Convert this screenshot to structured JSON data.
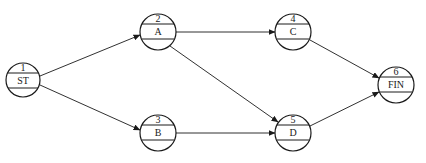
{
  "diagram": {
    "type": "activity-on-node network",
    "nodes": [
      {
        "id": "1",
        "number": "1",
        "label": "ST",
        "cx": 23,
        "cy": 80
      },
      {
        "id": "2",
        "number": "2",
        "label": "A",
        "cx": 158,
        "cy": 32
      },
      {
        "id": "3",
        "number": "3",
        "label": "B",
        "cx": 158,
        "cy": 133
      },
      {
        "id": "4",
        "number": "4",
        "label": "C",
        "cx": 293,
        "cy": 32
      },
      {
        "id": "5",
        "number": "5",
        "label": "D",
        "cx": 293,
        "cy": 133
      },
      {
        "id": "6",
        "number": "6",
        "label": "FIN",
        "cx": 396,
        "cy": 85
      }
    ],
    "edges": [
      {
        "from": "1",
        "to": "2"
      },
      {
        "from": "1",
        "to": "3"
      },
      {
        "from": "2",
        "to": "4"
      },
      {
        "from": "2",
        "to": "5"
      },
      {
        "from": "3",
        "to": "5"
      },
      {
        "from": "4",
        "to": "6"
      },
      {
        "from": "5",
        "to": "6"
      }
    ],
    "colors": {
      "stroke": "#1a1a1a",
      "background": "#ffffff"
    }
  }
}
